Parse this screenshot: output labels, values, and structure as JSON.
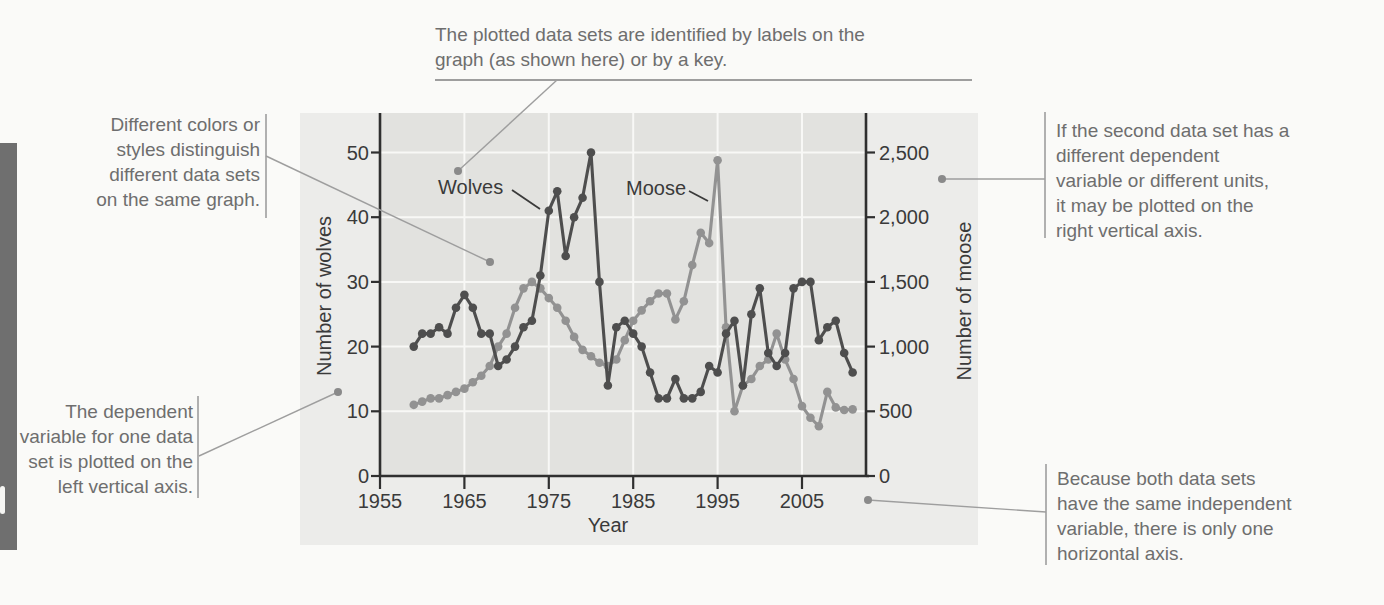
{
  "annotations": {
    "labels_key": {
      "lines": [
        "The plotted data sets are identified by labels on the",
        "graph (as shown here) or by a key."
      ]
    },
    "colors_styles": {
      "lines": [
        "Different colors or",
        "styles distinguish",
        "different data sets",
        "on the same graph."
      ]
    },
    "left_axis_note": {
      "lines": [
        "The dependent",
        "variable for one data",
        "set is plotted on the",
        "left vertical axis."
      ]
    },
    "right_axis_note": {
      "lines": [
        "If the second data set has a",
        "different dependent",
        "variable or different units,",
        "it may be plotted on the",
        "right vertical axis."
      ]
    },
    "horizontal_axis_note": {
      "lines": [
        "Because both data sets",
        "have the same independent",
        "variable, there is only one",
        "horizontal axis."
      ]
    }
  },
  "chart_data": {
    "type": "line",
    "xlabel": "Year",
    "ylabel_left": "Number of wolves",
    "ylabel_right": "Number of moose",
    "x_ticks": [
      "1955",
      "1965",
      "1975",
      "1985",
      "1995",
      "2005"
    ],
    "y_ticks_left": [
      "0",
      "10",
      "20",
      "30",
      "40",
      "50"
    ],
    "y_ticks_right": [
      "0",
      "500",
      "1,000",
      "1,500",
      "2,000",
      "2,500"
    ],
    "xlim": [
      1955,
      2012.5
    ],
    "ylim_left": [
      0,
      56
    ],
    "ylim_right": [
      0,
      2800
    ],
    "grid": true,
    "legend": "inline-labels",
    "x": [
      1959,
      1960,
      1961,
      1962,
      1963,
      1964,
      1965,
      1966,
      1967,
      1968,
      1969,
      1970,
      1971,
      1972,
      1973,
      1974,
      1975,
      1976,
      1977,
      1978,
      1979,
      1980,
      1981,
      1982,
      1983,
      1984,
      1985,
      1986,
      1987,
      1988,
      1989,
      1990,
      1991,
      1992,
      1993,
      1994,
      1995,
      1996,
      1997,
      1998,
      1999,
      2000,
      2001,
      2002,
      2003,
      2004,
      2005,
      2006,
      2007,
      2008,
      2009,
      2010,
      2011
    ],
    "series": [
      {
        "name": "Moose",
        "axis": "right",
        "color": "#929292",
        "values": [
          550,
          575,
          600,
          600,
          625,
          650,
          675,
          725,
          775,
          850,
          1000,
          1100,
          1300,
          1450,
          1500,
          1450,
          1375,
          1300,
          1200,
          1075,
          975,
          925,
          875,
          850,
          900,
          1050,
          1200,
          1280,
          1350,
          1410,
          1410,
          1210,
          1350,
          1630,
          1880,
          1800,
          2440,
          1150,
          500,
          700,
          750,
          850,
          900,
          1100,
          900,
          750,
          540,
          450,
          385,
          650,
          530,
          510,
          515
        ]
      },
      {
        "name": "Wolves",
        "axis": "left",
        "color": "#4e4e4e",
        "values": [
          20,
          22,
          22,
          23,
          22,
          26,
          28,
          26,
          22,
          22,
          17,
          18,
          20,
          23,
          24,
          31,
          41,
          44,
          34,
          40,
          43,
          50,
          30,
          14,
          23,
          24,
          22,
          20,
          16,
          12,
          12,
          15,
          12,
          12,
          13,
          17,
          16,
          22,
          24,
          14,
          25,
          29,
          19,
          17,
          19,
          29,
          30,
          30,
          21,
          23,
          24,
          19,
          16
        ]
      }
    ],
    "colors": {
      "panel": "#ececea",
      "plot_background": "#e2e2df",
      "gridline": "#f8f8f6",
      "axis": "#2f2f2f",
      "annotation_text": "#6e6e6e",
      "callout_line": "#9e9e9e",
      "callout_dot": "#8a8a8a"
    }
  }
}
